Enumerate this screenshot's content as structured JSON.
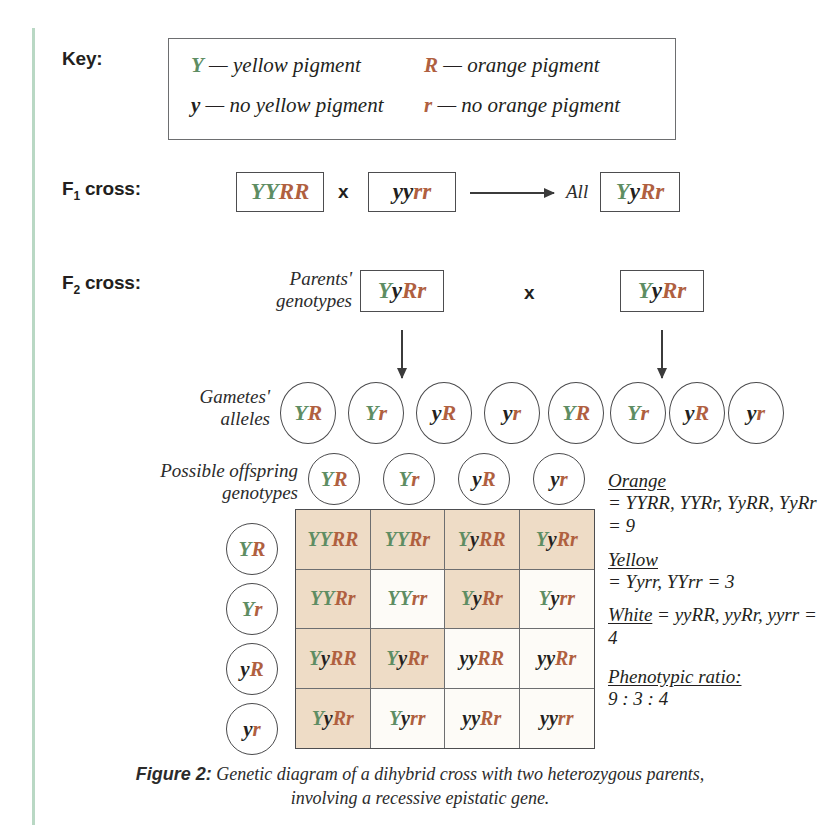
{
  "key": {
    "label": "Key:",
    "entries": [
      {
        "symbol": "Y",
        "symbol_color": "green",
        "text": "— yellow pigment"
      },
      {
        "symbol": "R",
        "symbol_color": "orange",
        "text": "— orange pigment"
      },
      {
        "symbol": "y",
        "symbol_color": "black",
        "text": "— no yellow pigment"
      },
      {
        "symbol": "r",
        "symbol_color": "orange",
        "text": "— no orange pigment"
      }
    ]
  },
  "f1": {
    "label": "F1 cross:",
    "label_main": "F",
    "label_sub": "1",
    "label_tail": " cross:",
    "parent_left": "YYRR",
    "cross_symbol": "x",
    "parent_right": "yyrr",
    "result_prefix": "All",
    "result": "YyRr"
  },
  "f2": {
    "label_main": "F",
    "label_sub": "2",
    "label_tail": " cross:",
    "parents_label_line1": "Parents'",
    "parents_label_line2": "genotypes",
    "parent_left": "YyRr",
    "cross_symbol": "x",
    "parent_right": "YyRr",
    "gametes_label_line1": "Gametes'",
    "gametes_label_line2": "alleles",
    "gametes_left": [
      "YR",
      "Yr",
      "yR",
      "yr"
    ],
    "gametes_right": [
      "YR",
      "Yr",
      "yR",
      "yr"
    ],
    "offspring_label_line1": "Possible offspring",
    "offspring_label_line2": "genotypes"
  },
  "punnett": {
    "col_headers": [
      "YR",
      "Yr",
      "yR",
      "yr"
    ],
    "row_headers": [
      "YR",
      "Yr",
      "yR",
      "yr"
    ],
    "cells": [
      [
        {
          "g": "YYRR",
          "shaded": true
        },
        {
          "g": "YYRr",
          "shaded": true
        },
        {
          "g": "YyRR",
          "shaded": true
        },
        {
          "g": "YyRr",
          "shaded": true
        }
      ],
      [
        {
          "g": "YYRr",
          "shaded": true
        },
        {
          "g": "YYrr",
          "shaded": false
        },
        {
          "g": "YyRr",
          "shaded": true
        },
        {
          "g": "Yyrr",
          "shaded": false
        }
      ],
      [
        {
          "g": "YyRR",
          "shaded": true
        },
        {
          "g": "YyRr",
          "shaded": true
        },
        {
          "g": "yyRR",
          "shaded": false
        },
        {
          "g": "yyRr",
          "shaded": false
        }
      ],
      [
        {
          "g": "YyRr",
          "shaded": true
        },
        {
          "g": "Yyrr",
          "shaded": false
        },
        {
          "g": "yyRr",
          "shaded": false
        },
        {
          "g": "yyrr",
          "shaded": false
        }
      ]
    ]
  },
  "legend": [
    {
      "head": "Orange",
      "body": "= YYRR, YYRr, YyRR, YyRr = 9",
      "count": 9
    },
    {
      "head": "Yellow",
      "body": "= Yyrr, YYrr = 3",
      "count": 3
    },
    {
      "head": "White",
      "body": "= yyRR, yyRr, yyrr = 4",
      "count": 4,
      "inline": true
    },
    {
      "head": "Phenotypic ratio:",
      "body": "9 : 3 : 4"
    }
  ],
  "caption": {
    "figure": "Figure 2:",
    "text": "Genetic diagram of a dihybrid cross with two heterozygous parents, involving a recessive epistatic gene."
  },
  "colors": {
    "green": "#5e8d63",
    "orange": "#b0603f",
    "black": "#231f20",
    "shaded_cell": "#eedcc6",
    "plain_cell": "#fdfbf7",
    "rule": "#b9d8c4"
  }
}
